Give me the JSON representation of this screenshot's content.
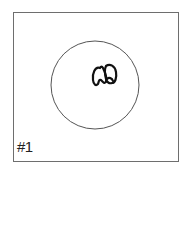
{
  "panel": {
    "label": "#1",
    "frame_color": "#6e6e6e",
    "circle_color": "#555555",
    "drawing_color": "#111111",
    "drawing": "two-loops-doodle"
  }
}
